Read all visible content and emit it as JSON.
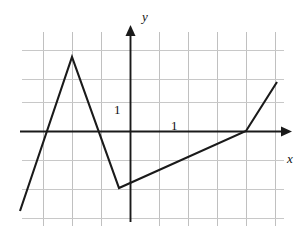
{
  "figure": {
    "kind": "cartesian-graph",
    "background": "#ffffff",
    "width": 306,
    "height": 236
  },
  "labels": {
    "y_axis": "y",
    "x_axis": "x",
    "y_unit": "1",
    "x_unit": "1"
  },
  "colors": {
    "grid": "#c8c8c8",
    "axis": "#1a1a1a",
    "curve": "#1a1a1a",
    "text": "#111111"
  },
  "chart_data": {
    "type": "line",
    "title": "",
    "xlabel": "x",
    "ylabel": "y",
    "grid": true,
    "legend": null,
    "xlim": [
      -3.9,
      5.2
    ],
    "ylim": [
      -2.9,
      2.9
    ],
    "x_tick_unit": 1,
    "y_tick_unit": 1,
    "x_ticks": [
      -3,
      -2,
      -1,
      0,
      1,
      2,
      3,
      4,
      5
    ],
    "y_ticks": [
      -2,
      -1,
      0,
      1,
      2
    ],
    "annotations": [
      {
        "text": "1",
        "x": -0.55,
        "y": 0.55,
        "role": "y-unit-marker"
      },
      {
        "text": "1",
        "x": 1.4,
        "y": 0.3,
        "role": "x-unit-marker"
      }
    ],
    "series": [
      {
        "name": "piecewise-linear",
        "description": "Piecewise linear graph with four segments",
        "points": [
          {
            "x": -3.8,
            "y": -2.75
          },
          {
            "x": -2.0,
            "y": 2.55
          },
          {
            "x": -0.4,
            "y": -1.95
          },
          {
            "x": 4.0,
            "y": 0.0
          },
          {
            "x": 5.05,
            "y": 1.7
          }
        ]
      }
    ],
    "vertices_pixels": [
      {
        "x": 20,
        "y": 211
      },
      {
        "x": 72,
        "y": 57
      },
      {
        "x": 119,
        "y": 188
      },
      {
        "x": 246,
        "y": 131
      },
      {
        "x": 277,
        "y": 82
      }
    ]
  },
  "grid_geometry": {
    "x_lines": [
      43,
      72,
      101,
      130,
      159,
      188,
      217,
      246,
      275
    ],
    "y_lines": [
      50,
      79,
      102,
      131,
      160,
      189,
      218
    ],
    "origin_px": {
      "x": 130,
      "y": 131
    },
    "x_axis_from": 20,
    "x_axis_to": 285,
    "y_axis_from": 222,
    "y_axis_to": 27
  }
}
